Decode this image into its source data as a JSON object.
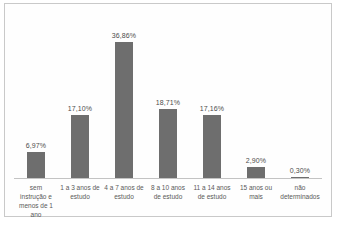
{
  "chart_data": {
    "type": "bar",
    "title": "",
    "xlabel": "",
    "ylabel": "",
    "categories": [
      "sem instrução e menos de 1 ano",
      "1 a 3 anos de estudo",
      "4 a 7 anos de estudo",
      "8 a 10 anos de estudo",
      "11 a 14 anos de estudo",
      "15 anos ou mais",
      "não determinados"
    ],
    "values": [
      6.97,
      17.1,
      36.86,
      18.71,
      17.16,
      2.9,
      0.3
    ],
    "value_labels": [
      "6,97%",
      "17,10%",
      "36,86%",
      "18,71%",
      "17,16%",
      "2,90%",
      "0,30%"
    ],
    "ylim": [
      0,
      40
    ],
    "grid": false,
    "legend": "none",
    "bar_color": "#6e6e6e",
    "axis_color": "#c3c3c3",
    "label_color": "#595959"
  }
}
